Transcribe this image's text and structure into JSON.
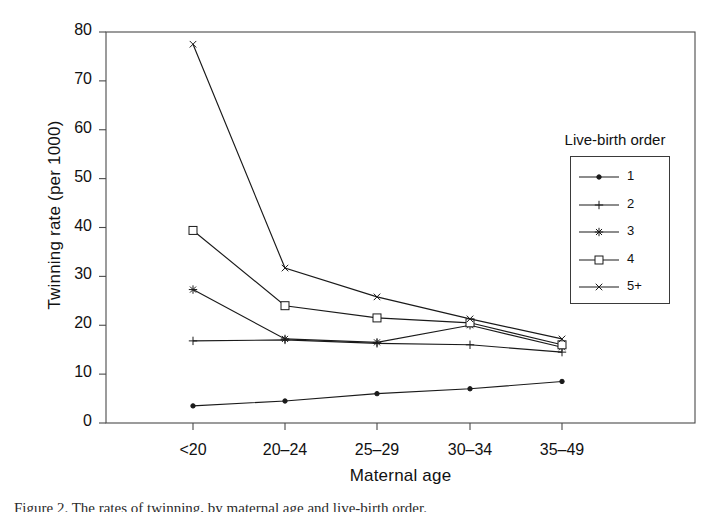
{
  "chart_data": {
    "type": "line",
    "title": "",
    "xlabel": "Maternal age",
    "ylabel": "Twinning rate (per 1000)",
    "categories": [
      "<20",
      "20–24",
      "25–29",
      "30–34",
      "35–49"
    ],
    "xlim": [
      0,
      6
    ],
    "ylim": [
      0,
      80
    ],
    "yticks": [
      0,
      10,
      20,
      30,
      40,
      50,
      60,
      70,
      80
    ],
    "grid": false,
    "legend_position": "right-inside",
    "legend_title": "Live-birth order",
    "series": [
      {
        "name": "1",
        "marker": "dot",
        "values": [
          3.5,
          4.5,
          6.0,
          7.0,
          8.5
        ]
      },
      {
        "name": "2",
        "marker": "plus",
        "values": [
          16.8,
          17.0,
          16.3,
          16.0,
          14.5
        ]
      },
      {
        "name": "3",
        "marker": "asterisk",
        "values": [
          27.3,
          17.2,
          16.5,
          20.0,
          15.5
        ]
      },
      {
        "name": "4",
        "marker": "square",
        "values": [
          39.4,
          24.0,
          21.5,
          20.5,
          16.0
        ]
      },
      {
        "name": "5+",
        "marker": "cross",
        "values": [
          77.5,
          31.7,
          25.8,
          21.3,
          17.2
        ]
      }
    ],
    "line_color": "#1a1a1a",
    "frame_color": "#4a4a4a"
  },
  "caption": "Figure 2. The rates of twinning, by maternal age and live-birth order."
}
